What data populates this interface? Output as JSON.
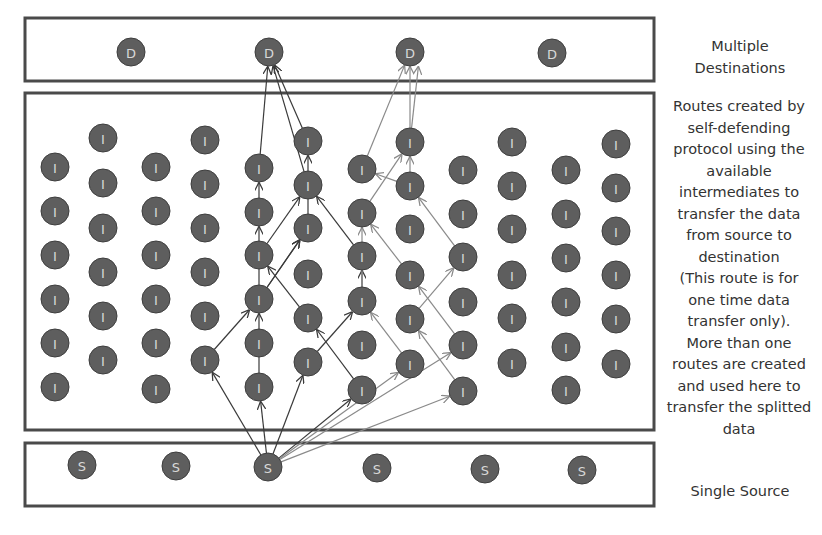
{
  "labels": {
    "destinations": [
      "Multiple",
      "Destinations"
    ],
    "intermediates": [
      "Routes created by",
      "self-defending",
      "protocol using the",
      "available",
      "intermediates to",
      "transfer the data",
      "from source to",
      "destination",
      "(This route is for",
      "one time data",
      "transfer only).",
      "More than one",
      "routes are created",
      "and used here to",
      "transfer the splitted",
      "data"
    ],
    "source": [
      "Single Source"
    ]
  },
  "node_letters": {
    "destination": "D",
    "intermediate": "I",
    "source": "S"
  },
  "colors": {
    "node_fill": "#5e5e5e",
    "route_dark": "#3a3a3a",
    "route_light": "#8a8a8a",
    "box_stroke": "#4a4a4a"
  },
  "boxes": {
    "destinations": {
      "x": 25,
      "y": 18,
      "w": 222,
      "h": 63
    },
    "intermediates": {
      "x": 25,
      "y": 93,
      "w": 222,
      "h": 337
    },
    "source": {
      "x": 25,
      "y": 443,
      "w": 222,
      "h": 63
    }
  },
  "destination_nodes": [
    {
      "x": 131,
      "y": 52
    },
    {
      "x": 269,
      "y": 52
    },
    {
      "x": 410,
      "y": 52
    },
    {
      "x": 552,
      "y": 53
    }
  ],
  "source_nodes": [
    {
      "x": 82,
      "y": 465
    },
    {
      "x": 176,
      "y": 466
    },
    {
      "x": 268,
      "y": 467
    },
    {
      "x": 377,
      "y": 468
    },
    {
      "x": 485,
      "y": 469
    },
    {
      "x": 582,
      "y": 470
    }
  ],
  "intermediate_nodes": [
    {
      "x": 55,
      "y": 167
    },
    {
      "x": 55,
      "y": 211
    },
    {
      "x": 55,
      "y": 255
    },
    {
      "x": 55,
      "y": 299
    },
    {
      "x": 55,
      "y": 343
    },
    {
      "x": 55,
      "y": 387
    },
    {
      "x": 103,
      "y": 138
    },
    {
      "x": 103,
      "y": 183
    },
    {
      "x": 103,
      "y": 228
    },
    {
      "x": 103,
      "y": 272
    },
    {
      "x": 103,
      "y": 316
    },
    {
      "x": 103,
      "y": 360
    },
    {
      "x": 156,
      "y": 167
    },
    {
      "x": 156,
      "y": 211
    },
    {
      "x": 156,
      "y": 255
    },
    {
      "x": 156,
      "y": 299
    },
    {
      "x": 156,
      "y": 343
    },
    {
      "x": 156,
      "y": 389
    },
    {
      "x": 205,
      "y": 140
    },
    {
      "x": 205,
      "y": 184
    },
    {
      "x": 205,
      "y": 228
    },
    {
      "x": 205,
      "y": 272
    },
    {
      "x": 205,
      "y": 316
    },
    {
      "x": 205,
      "y": 360
    },
    {
      "x": 259,
      "y": 168
    },
    {
      "x": 259,
      "y": 212
    },
    {
      "x": 259,
      "y": 255
    },
    {
      "x": 259,
      "y": 299
    },
    {
      "x": 259,
      "y": 343
    },
    {
      "x": 259,
      "y": 387
    },
    {
      "x": 308,
      "y": 141
    },
    {
      "x": 308,
      "y": 185
    },
    {
      "x": 308,
      "y": 228
    },
    {
      "x": 308,
      "y": 274
    },
    {
      "x": 308,
      "y": 318
    },
    {
      "x": 308,
      "y": 362
    },
    {
      "x": 362,
      "y": 169
    },
    {
      "x": 362,
      "y": 213
    },
    {
      "x": 362,
      "y": 256
    },
    {
      "x": 362,
      "y": 301
    },
    {
      "x": 362,
      "y": 345
    },
    {
      "x": 362,
      "y": 390
    },
    {
      "x": 410,
      "y": 142
    },
    {
      "x": 410,
      "y": 186
    },
    {
      "x": 410,
      "y": 229
    },
    {
      "x": 410,
      "y": 275
    },
    {
      "x": 410,
      "y": 319
    },
    {
      "x": 410,
      "y": 364
    },
    {
      "x": 463,
      "y": 170
    },
    {
      "x": 463,
      "y": 214
    },
    {
      "x": 463,
      "y": 257
    },
    {
      "x": 463,
      "y": 302
    },
    {
      "x": 463,
      "y": 345
    },
    {
      "x": 463,
      "y": 391
    },
    {
      "x": 512,
      "y": 142
    },
    {
      "x": 512,
      "y": 186
    },
    {
      "x": 512,
      "y": 229
    },
    {
      "x": 512,
      "y": 275
    },
    {
      "x": 512,
      "y": 318
    },
    {
      "x": 512,
      "y": 363
    },
    {
      "x": 566,
      "y": 170
    },
    {
      "x": 566,
      "y": 214
    },
    {
      "x": 566,
      "y": 258
    },
    {
      "x": 566,
      "y": 302
    },
    {
      "x": 566,
      "y": 347
    },
    {
      "x": 566,
      "y": 390
    },
    {
      "x": 616,
      "y": 144
    },
    {
      "x": 616,
      "y": 188
    },
    {
      "x": 616,
      "y": 231
    },
    {
      "x": 616,
      "y": 275
    },
    {
      "x": 616,
      "y": 319
    },
    {
      "x": 616,
      "y": 364
    }
  ],
  "routes": [
    {
      "style": "dark",
      "points": [
        [
          268,
          467
        ],
        [
          205,
          360
        ],
        [
          259,
          299
        ],
        [
          308,
          228
        ],
        [
          308,
          141
        ],
        [
          269,
          52
        ]
      ]
    },
    {
      "style": "dark",
      "points": [
        [
          268,
          467
        ],
        [
          308,
          362
        ],
        [
          362,
          301
        ],
        [
          362,
          256
        ],
        [
          308,
          185
        ],
        [
          269,
          52
        ]
      ]
    },
    {
      "style": "dark",
      "points": [
        [
          268,
          467
        ],
        [
          362,
          390
        ],
        [
          308,
          318
        ],
        [
          259,
          255
        ],
        [
          308,
          185
        ]
      ]
    },
    {
      "style": "dark",
      "points": [
        [
          268,
          467
        ],
        [
          259,
          387
        ],
        [
          259,
          299
        ],
        [
          259,
          212
        ],
        [
          259,
          168
        ],
        [
          269,
          52
        ]
      ]
    },
    {
      "style": "dark",
      "points": [
        [
          259,
          299
        ],
        [
          308,
          228
        ]
      ]
    },
    {
      "style": "light",
      "points": [
        [
          268,
          467
        ],
        [
          410,
          364
        ],
        [
          362,
          301
        ],
        [
          362,
          213
        ],
        [
          410,
          142
        ],
        [
          410,
          52
        ]
      ]
    },
    {
      "style": "light",
      "points": [
        [
          268,
          467
        ],
        [
          463,
          345
        ],
        [
          410,
          275
        ],
        [
          362,
          213
        ]
      ]
    },
    {
      "style": "light",
      "points": [
        [
          268,
          467
        ],
        [
          463,
          391
        ],
        [
          410,
          319
        ],
        [
          463,
          257
        ],
        [
          410,
          186
        ],
        [
          410,
          142
        ]
      ]
    },
    {
      "style": "light",
      "points": [
        [
          362,
          169
        ],
        [
          410,
          52
        ]
      ]
    },
    {
      "style": "light",
      "points": [
        [
          410,
          186
        ],
        [
          362,
          169
        ]
      ]
    },
    {
      "style": "light",
      "points": [
        [
          410,
          142
        ],
        [
          420,
          52
        ]
      ]
    }
  ]
}
